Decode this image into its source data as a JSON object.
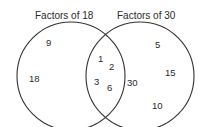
{
  "diagram": {
    "type": "venn",
    "sets": [
      {
        "label": "Factors of 18",
        "only": [
          "9",
          "18"
        ]
      },
      {
        "label": "Factors of 30",
        "only": [
          "5",
          "15",
          "30",
          "10"
        ]
      }
    ],
    "intersection": [
      "1",
      "2",
      "3",
      "6"
    ]
  },
  "labels": {
    "left": "Factors of 18",
    "right": "Factors of 30"
  },
  "numbers": {
    "left_9": "9",
    "left_18": "18",
    "mid_1": "1",
    "mid_2": "2",
    "mid_3": "3",
    "mid_6": "6",
    "right_30": "30",
    "right_5": "5",
    "right_15": "15",
    "right_10": "10"
  },
  "colors": {
    "stroke": "#333333",
    "text": "#2a2a2a",
    "background": "#ffffff"
  }
}
